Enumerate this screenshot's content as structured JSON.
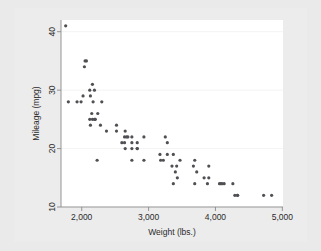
{
  "figure": {
    "background_color": "#ececec",
    "plot_background_color": "#ffffff",
    "marker_color": "#4f4f54",
    "gridline_color": "#f2f2f2",
    "axis_color": "#8a8a8a"
  },
  "chart_data": {
    "type": "scatter",
    "title": "",
    "xlabel": "Weight (lbs.)",
    "ylabel": "Mileage (mpg)",
    "xlim": [
      1690,
      5010
    ],
    "ylim": [
      10,
      42
    ],
    "xticks": [
      2000,
      3000,
      4000,
      5000
    ],
    "xticklabels": [
      "2,000",
      "3,000",
      "4,000",
      "5,000"
    ],
    "yticks": [
      10,
      20,
      30,
      40
    ],
    "yticklabels": [
      "10",
      "20",
      "30",
      "40"
    ],
    "grid": "horizontal",
    "legend": "none",
    "marker_size_px": 3.2,
    "n_points": 74,
    "series": [
      {
        "name": "Mileage vs Weight",
        "x": [
          2930,
          3350,
          2640,
          3250,
          4080,
          3670,
          2230,
          3280,
          3880,
          3400,
          4330,
          3900,
          4290,
          4330,
          3900,
          4260,
          3690,
          3180,
          3220,
          4130,
          4060,
          3720,
          3370,
          2830,
          2930,
          3470,
          2070,
          2120,
          2300,
          2190,
          2200,
          2150,
          2650,
          2750,
          2370,
          2020,
          2130,
          2190,
          2690,
          2130,
          2650,
          2750,
          2280,
          2750,
          2170,
          2600,
          2640,
          2830,
          3430,
          3280,
          4720,
          4840,
          3830,
          4100,
          2200,
          2520,
          2240,
          2520,
          2160,
          2040,
          1930,
          1990,
          3170,
          2670,
          3690,
          3420,
          3370,
          2830,
          2160,
          1800,
          1760,
          2050,
          2120,
          2750
        ],
        "y": [
          22,
          17,
          22,
          22,
          14,
          17,
          18,
          21,
          14,
          16,
          12,
          17,
          12,
          12,
          15,
          14,
          14,
          18,
          18,
          14,
          14,
          16,
          14,
          20,
          18,
          18,
          35,
          30,
          28,
          25,
          25,
          26,
          20,
          18,
          23,
          29,
          29,
          30,
          22,
          24,
          23,
          22,
          24,
          20,
          28,
          21,
          21,
          20,
          15,
          19,
          12,
          12,
          15,
          14,
          25,
          23,
          26,
          24,
          31,
          34,
          28,
          28,
          19,
          22,
          18,
          17,
          19,
          21,
          25,
          28,
          41,
          35,
          25,
          21
        ]
      }
    ]
  }
}
